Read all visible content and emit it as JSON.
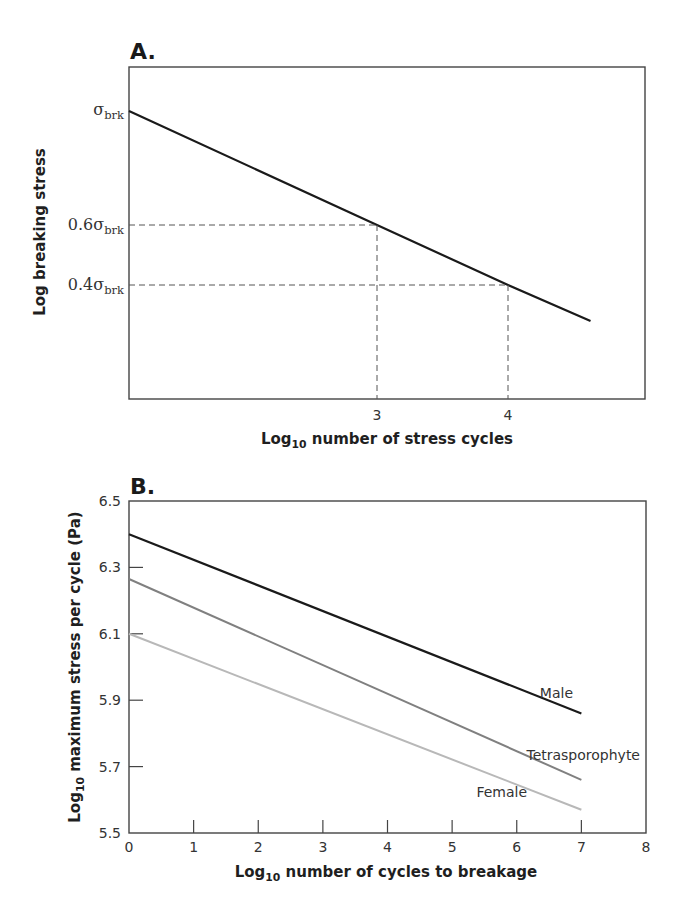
{
  "chart_data": [
    {
      "panel": "A.",
      "type": "line",
      "title": "",
      "xlabel": "Log10 number of stress cycles",
      "xlabel_parts": {
        "pre": "Log",
        "sub": "10",
        "post": " number of stress cycles"
      },
      "ylabel": "Log breaking stress",
      "x_ticks": [
        "3",
        "4"
      ],
      "y_ticks": [
        {
          "label": "σ",
          "sub": "brk",
          "prefix": ""
        },
        {
          "label": "σ",
          "sub": "brk",
          "prefix": "0.6"
        },
        {
          "label": "σ",
          "sub": "brk",
          "prefix": "0.4"
        }
      ],
      "series": [
        {
          "name": "S-N curve",
          "color": "#1a1a1a",
          "points": [
            {
              "x": 1.13,
              "y": 1.0
            },
            {
              "x": 3,
              "y": 0.6
            },
            {
              "x": 4,
              "y": 0.4
            },
            {
              "x": 4.63,
              "y": 0.27
            }
          ]
        }
      ],
      "annotations": [
        {
          "type": "dashed-guide",
          "x": 3,
          "y_label": "0.6σbrk"
        },
        {
          "type": "dashed-guide",
          "x": 4,
          "y_label": "0.4σbrk"
        }
      ],
      "grid": false,
      "legend": "none"
    },
    {
      "panel": "B.",
      "type": "line",
      "title": "",
      "xlabel": "Log10 number of cycles to breakage",
      "xlabel_parts": {
        "pre": "Log",
        "sub": "10",
        "post": " number of cycles to breakage"
      },
      "ylabel": "Log10 maximum stress per cycle (Pa)",
      "ylabel_parts": {
        "pre": "Log",
        "sub": "10",
        "post": " maximum stress per cycle (Pa)"
      },
      "x": [
        0,
        7
      ],
      "x_ticks": [
        "0",
        "1",
        "2",
        "3",
        "4",
        "5",
        "6",
        "7",
        "8"
      ],
      "y_ticks": [
        "5.5",
        "5.7",
        "5.9",
        "6.1",
        "6.3",
        "6.5"
      ],
      "xlim": [
        0,
        8
      ],
      "ylim": [
        5.5,
        6.5
      ],
      "series": [
        {
          "name": "Male",
          "color": "#1a1a1a",
          "values": [
            6.4,
            5.86
          ]
        },
        {
          "name": "Tetrasporophyte",
          "color": "#808080",
          "values": [
            6.265,
            5.66
          ]
        },
        {
          "name": "Female",
          "color": "#b8b8b8",
          "values": [
            6.1,
            5.57
          ]
        }
      ],
      "grid": false,
      "legend": "inline labels near line ends"
    }
  ]
}
